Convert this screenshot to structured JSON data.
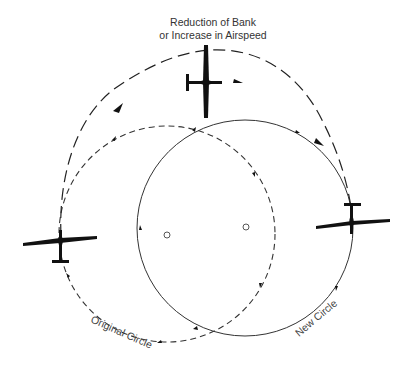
{
  "diagram": {
    "title_lines": [
      "Reduction of Bank",
      "or Increase in Airspeed"
    ],
    "labels": {
      "original_circle": "Original Circle",
      "new_circle": "New Circle"
    },
    "colors": {
      "ink": "#111111",
      "line": "#333333",
      "background": "#ffffff"
    },
    "elements": {
      "original_circle": {
        "style": "dashed",
        "center": [
          167,
          234
        ],
        "radius": 108,
        "direction": "clockwise"
      },
      "new_circle": {
        "style": "solid",
        "center": [
          245,
          228
        ],
        "radius": 108,
        "direction": "clockwise"
      },
      "transition_path": {
        "style": "long-dashed",
        "from": "left-glider",
        "via": "top-glider",
        "to": "right-glider"
      },
      "gliders": [
        "left-glider",
        "top-glider",
        "right-glider"
      ]
    }
  }
}
